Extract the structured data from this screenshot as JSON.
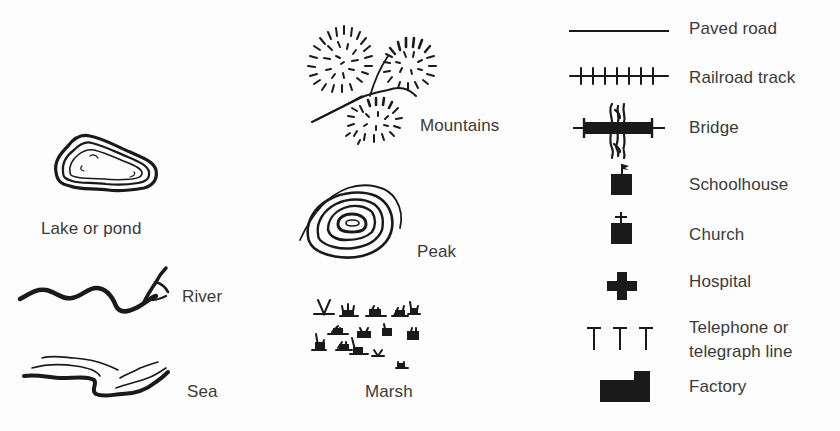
{
  "legend": {
    "title": "",
    "ink_color": "#1a1a1a",
    "text_color": "#3a3a3a",
    "background": "#fdfdfd",
    "columns": [
      {
        "name": "water-features",
        "items": [
          {
            "id": "lake",
            "label": "Lake or pond",
            "icon": "lake-icon"
          },
          {
            "id": "river",
            "label": "River",
            "icon": "river-icon"
          },
          {
            "id": "sea",
            "label": "Sea",
            "icon": "sea-icon"
          }
        ]
      },
      {
        "name": "terrain-features",
        "items": [
          {
            "id": "mountains",
            "label": "Mountains",
            "icon": "mountains-icon"
          },
          {
            "id": "peak",
            "label": "Peak",
            "icon": "peak-icon"
          },
          {
            "id": "marsh",
            "label": "Marsh",
            "icon": "marsh-icon"
          }
        ]
      },
      {
        "name": "man-made-features",
        "items": [
          {
            "id": "paved_road",
            "label": "Paved road",
            "icon": "paved-road-icon"
          },
          {
            "id": "railroad",
            "label": "Railroad track",
            "icon": "railroad-track-icon"
          },
          {
            "id": "bridge",
            "label": "Bridge",
            "icon": "bridge-icon"
          },
          {
            "id": "schoolhouse",
            "label": "Schoolhouse",
            "icon": "schoolhouse-icon"
          },
          {
            "id": "church",
            "label": "Church",
            "icon": "church-icon"
          },
          {
            "id": "hospital",
            "label": "Hospital",
            "icon": "hospital-icon"
          },
          {
            "id": "telephone",
            "label_line1": "Telephone or",
            "label_line2": "telegraph line",
            "icon": "telephone-line-icon"
          },
          {
            "id": "factory",
            "label": "Factory",
            "icon": "factory-icon"
          }
        ]
      }
    ]
  }
}
